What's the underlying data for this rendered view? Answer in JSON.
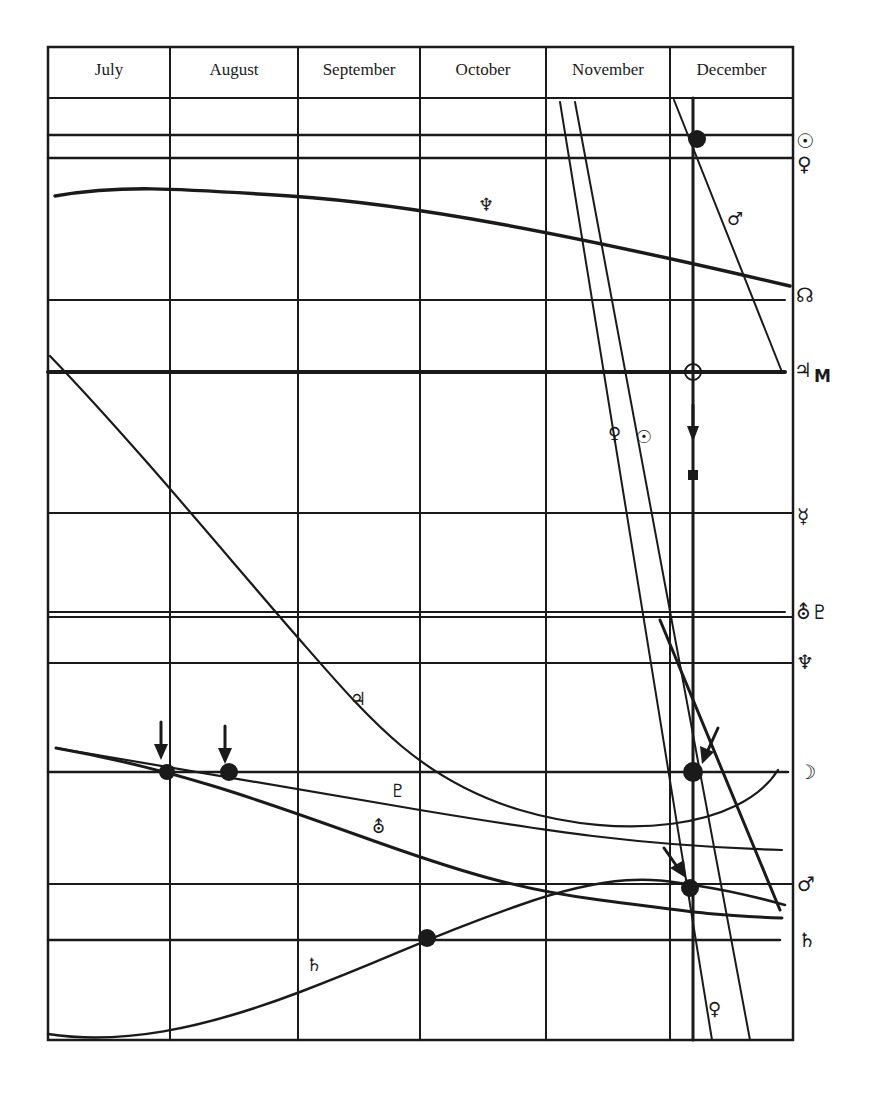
{
  "diagram": {
    "type": "astrological transit chart (planetary positions over months)",
    "months": [
      "July",
      "August",
      "September",
      "October",
      "November",
      "December"
    ],
    "right_axis_symbols": [
      {
        "name": "sun",
        "glyph": "☉",
        "y": 140
      },
      {
        "name": "venus",
        "glyph": "♀",
        "y": 165
      },
      {
        "name": "north-node",
        "glyph": "☊",
        "y": 296
      },
      {
        "name": "jupiter-mc",
        "glyph": "♃",
        "suffix": "M",
        "y": 372
      },
      {
        "name": "mercury",
        "glyph": "☿",
        "y": 516
      },
      {
        "name": "uranus-pluto",
        "glyph": "⛢♇",
        "y": 612
      },
      {
        "name": "neptune",
        "glyph": "♆",
        "y": 662
      },
      {
        "name": "moon",
        "glyph": "☽",
        "y": 773
      },
      {
        "name": "mars",
        "glyph": "♂",
        "y": 885
      },
      {
        "name": "saturn",
        "glyph": "♄",
        "y": 940
      }
    ],
    "curve_labels": [
      {
        "name": "neptune",
        "glyph": "♆",
        "x": 482,
        "y": 196
      },
      {
        "name": "mars",
        "glyph": "♂",
        "x": 728,
        "y": 210
      },
      {
        "name": "venus",
        "glyph": "♀",
        "x": 610,
        "y": 428
      },
      {
        "name": "sun",
        "glyph": "☉",
        "x": 636,
        "y": 428
      },
      {
        "name": "jupiter",
        "glyph": "♃",
        "x": 354,
        "y": 692
      },
      {
        "name": "pluto",
        "glyph": "♇",
        "x": 394,
        "y": 784
      },
      {
        "name": "uranus",
        "glyph": "⛢",
        "x": 374,
        "y": 822
      },
      {
        "name": "saturn",
        "glyph": "♄",
        "x": 308,
        "y": 960
      },
      {
        "name": "venus-lower",
        "glyph": "♀",
        "x": 710,
        "y": 1002
      }
    ]
  }
}
